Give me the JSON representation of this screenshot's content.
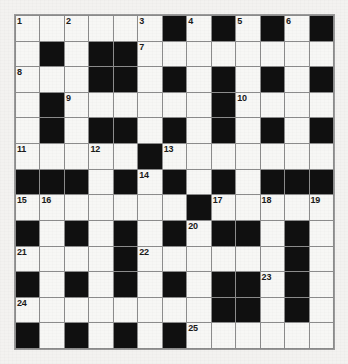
{
  "puzzle": {
    "type": "crossword-grid",
    "title": "Crossword Puzzle Grid",
    "rows": 13,
    "cols": 13,
    "colors": {
      "page_background": "#f3f2f0",
      "white_cell": "#f7f7f5",
      "black_cell": "#101010",
      "grid_line": "#8c8c8c",
      "number_text": "#1a1a1a"
    },
    "legend": {
      "W": "white-open-cell",
      "B": "black-blocked-cell"
    },
    "grid": [
      [
        "W",
        "W",
        "W",
        "W",
        "W",
        "W",
        "B",
        "W",
        "B",
        "W",
        "B",
        "W",
        "B"
      ],
      [
        "W",
        "B",
        "W",
        "B",
        "B",
        "W",
        "W",
        "W",
        "W",
        "W",
        "W",
        "W",
        "W"
      ],
      [
        "W",
        "W",
        "W",
        "B",
        "B",
        "W",
        "B",
        "W",
        "B",
        "W",
        "B",
        "W",
        "B"
      ],
      [
        "W",
        "B",
        "W",
        "W",
        "W",
        "W",
        "W",
        "W",
        "B",
        "W",
        "W",
        "W",
        "W"
      ],
      [
        "W",
        "B",
        "W",
        "B",
        "B",
        "W",
        "B",
        "W",
        "B",
        "W",
        "B",
        "W",
        "B"
      ],
      [
        "W",
        "W",
        "W",
        "W",
        "W",
        "B",
        "W",
        "W",
        "W",
        "W",
        "W",
        "W",
        "W"
      ],
      [
        "B",
        "B",
        "B",
        "W",
        "B",
        "W",
        "B",
        "W",
        "B",
        "W",
        "B",
        "B",
        "B"
      ],
      [
        "W",
        "W",
        "W",
        "W",
        "W",
        "W",
        "W",
        "B",
        "W",
        "W",
        "W",
        "W",
        "W"
      ],
      [
        "B",
        "W",
        "B",
        "W",
        "B",
        "W",
        "B",
        "W",
        "B",
        "B",
        "W",
        "B",
        "W"
      ],
      [
        "W",
        "W",
        "W",
        "W",
        "B",
        "W",
        "W",
        "W",
        "W",
        "W",
        "W",
        "B",
        "W"
      ],
      [
        "B",
        "W",
        "B",
        "W",
        "B",
        "W",
        "B",
        "W",
        "B",
        "B",
        "W",
        "B",
        "W"
      ],
      [
        "W",
        "W",
        "W",
        "W",
        "W",
        "W",
        "W",
        "W",
        "B",
        "B",
        "W",
        "B",
        "W"
      ],
      [
        "B",
        "W",
        "B",
        "W",
        "B",
        "W",
        "B",
        "W",
        "W",
        "W",
        "W",
        "W",
        "W"
      ]
    ],
    "numbers": [
      {
        "n": "1",
        "row": 0,
        "col": 0
      },
      {
        "n": "2",
        "row": 0,
        "col": 2
      },
      {
        "n": "3",
        "row": 0,
        "col": 5
      },
      {
        "n": "4",
        "row": 0,
        "col": 7
      },
      {
        "n": "5",
        "row": 0,
        "col": 9
      },
      {
        "n": "6",
        "row": 0,
        "col": 11
      },
      {
        "n": "7",
        "row": 1,
        "col": 5
      },
      {
        "n": "8",
        "row": 2,
        "col": 0
      },
      {
        "n": "9",
        "row": 3,
        "col": 2
      },
      {
        "n": "10",
        "row": 3,
        "col": 9
      },
      {
        "n": "11",
        "row": 5,
        "col": 0
      },
      {
        "n": "12",
        "row": 5,
        "col": 3
      },
      {
        "n": "13",
        "row": 5,
        "col": 6
      },
      {
        "n": "14",
        "row": 6,
        "col": 5
      },
      {
        "n": "15",
        "row": 7,
        "col": 0
      },
      {
        "n": "16",
        "row": 7,
        "col": 1
      },
      {
        "n": "17",
        "row": 7,
        "col": 8
      },
      {
        "n": "18",
        "row": 7,
        "col": 10
      },
      {
        "n": "19",
        "row": 7,
        "col": 12
      },
      {
        "n": "20",
        "row": 8,
        "col": 7
      },
      {
        "n": "21",
        "row": 9,
        "col": 0
      },
      {
        "n": "22",
        "row": 9,
        "col": 5
      },
      {
        "n": "23",
        "row": 10,
        "col": 10
      },
      {
        "n": "24",
        "row": 11,
        "col": 0
      },
      {
        "n": "25",
        "row": 12,
        "col": 7
      }
    ]
  }
}
